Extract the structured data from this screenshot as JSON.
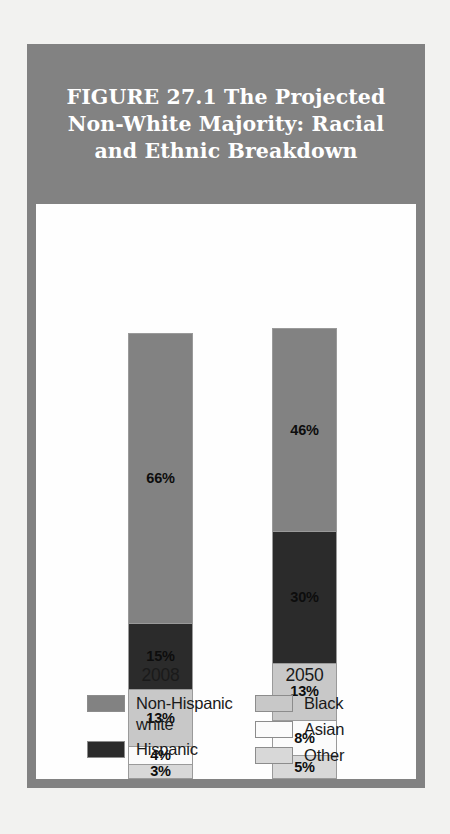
{
  "figure": {
    "title": "FIGURE 27.1   The Projected\nNon-White Majority: Racial\nand Ethnic Breakdown"
  },
  "colors": {
    "title_band": "#828282",
    "frame": "#828282",
    "panel": "#fefefe",
    "non_hispanic_white": "#828282",
    "hispanic": "#2b2b2b",
    "black": "#c8c8c8",
    "asian": "#fbfbfb",
    "other": "#d8d8d8",
    "segment_border": "#9a9a9a",
    "label_text": "#0d0d0d"
  },
  "legend": {
    "left_column": [
      {
        "label": "Non-Hispanic\nwhite",
        "key": "non_hispanic_white"
      },
      {
        "label": "Hispanic",
        "key": "hispanic"
      }
    ],
    "right_column": [
      {
        "label": "Black",
        "key": "black"
      },
      {
        "label": "Asian",
        "key": "asian"
      },
      {
        "label": "Other",
        "key": "other"
      }
    ]
  },
  "chart_data": {
    "type": "bar",
    "subtype": "stacked-percentage",
    "title": "FIGURE 27.1   The Projected Non-White Majority: Racial and Ethnic Breakdown",
    "xlabel": "",
    "ylabel": "",
    "ylim": [
      0,
      100
    ],
    "grid": false,
    "legend_position": "bottom",
    "categories": [
      "2008",
      "2050"
    ],
    "series": [
      {
        "name": "Non-Hispanic white",
        "values": [
          66,
          46
        ],
        "labels": [
          "66%",
          "46%"
        ],
        "color": "#828282"
      },
      {
        "name": "Hispanic",
        "values": [
          15,
          30
        ],
        "labels": [
          "15%",
          "30%"
        ],
        "color": "#2b2b2b"
      },
      {
        "name": "Black",
        "values": [
          13,
          13
        ],
        "labels": [
          "13%",
          "13%"
        ],
        "color": "#c8c8c8"
      },
      {
        "name": "Asian",
        "values": [
          4,
          8
        ],
        "labels": [
          "4%",
          "8%"
        ],
        "color": "#fbfbfb"
      },
      {
        "name": "Other",
        "values": [
          3,
          5
        ],
        "labels": [
          "3%",
          "5%"
        ],
        "color": "#d8d8d8"
      }
    ],
    "bars": [
      {
        "category": "2008",
        "tick_label": "2008",
        "segments": [
          {
            "name": "Non-Hispanic white",
            "value": 66,
            "label": "66%"
          },
          {
            "name": "Hispanic",
            "value": 15,
            "label": "15%"
          },
          {
            "name": "Black",
            "value": 13,
            "label": "13%"
          },
          {
            "name": "Asian",
            "value": 4,
            "label": "4%"
          },
          {
            "name": "Other",
            "value": 3,
            "label": "3%"
          }
        ]
      },
      {
        "category": "2050",
        "tick_label": "2050",
        "segments": [
          {
            "name": "Non-Hispanic white",
            "value": 46,
            "label": "46%"
          },
          {
            "name": "Hispanic",
            "value": 30,
            "label": "30%"
          },
          {
            "name": "Black",
            "value": 13,
            "label": "13%"
          },
          {
            "name": "Asian",
            "value": 8,
            "label": "8%"
          },
          {
            "name": "Other",
            "value": 5,
            "label": "5%"
          }
        ]
      }
    ]
  }
}
